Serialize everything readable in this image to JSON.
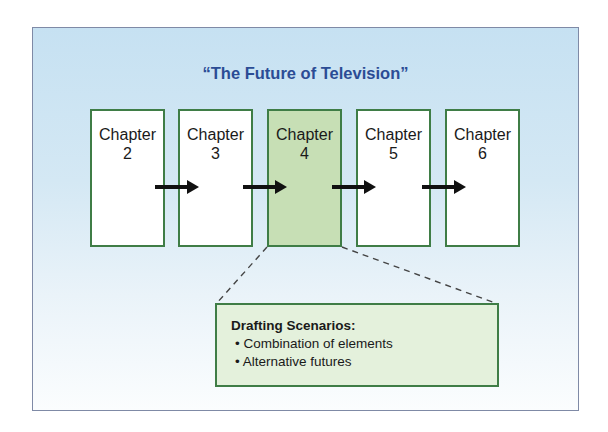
{
  "title": "“The Future of Television”",
  "chapters": [
    {
      "label": "Chapter",
      "number": "2",
      "active": false
    },
    {
      "label": "Chapter",
      "number": "3",
      "active": false
    },
    {
      "label": "Chapter",
      "number": "4",
      "active": true
    },
    {
      "label": "Chapter",
      "number": "5",
      "active": false
    },
    {
      "label": "Chapter",
      "number": "6",
      "active": false
    }
  ],
  "callout": {
    "heading": "Drafting Scenarios:",
    "items": [
      "• Combination of elements",
      "• Alternative futures"
    ]
  },
  "colors": {
    "title": "#2b4c95",
    "box_border": "#3f7d46",
    "active_fill": "#c7dfb5",
    "callout_fill": "#e4f1dc"
  }
}
